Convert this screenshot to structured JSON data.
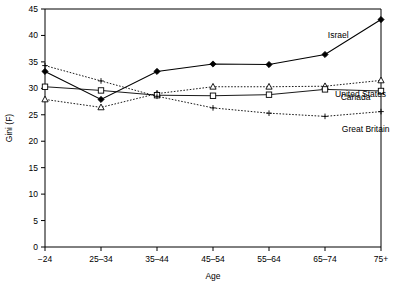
{
  "chart_data": {
    "type": "line",
    "title": "",
    "xlabel": "Age",
    "ylabel": "Gini (F)",
    "categories": [
      "−24",
      "25–34",
      "35–44",
      "45–54",
      "55–64",
      "65–74",
      "75+"
    ],
    "ylim": [
      0,
      45
    ],
    "yticks": [
      0,
      5,
      10,
      15,
      20,
      25,
      30,
      35,
      40,
      45
    ],
    "grid": false,
    "legend_position": "inline-right-of-lines",
    "series": [
      {
        "name": "Israel",
        "values": [
          33.2,
          27.9,
          33.2,
          34.6,
          34.5,
          36.4,
          43.0
        ],
        "marker": "filled-diamond",
        "line_style": "solid"
      },
      {
        "name": "United States",
        "values": [
          27.9,
          26.4,
          29.0,
          30.3,
          30.3,
          30.4,
          31.5
        ],
        "marker": "open-triangle",
        "line_style": "dotted"
      },
      {
        "name": "Canada",
        "values": [
          30.3,
          29.6,
          28.7,
          28.6,
          28.8,
          29.8,
          29.5
        ],
        "marker": "open-square",
        "line_style": "solid"
      },
      {
        "name": "Great Britain",
        "values": [
          34.3,
          31.4,
          28.5,
          26.3,
          25.3,
          24.7,
          25.6
        ],
        "marker": "plus",
        "line_style": "dotted"
      }
    ]
  }
}
